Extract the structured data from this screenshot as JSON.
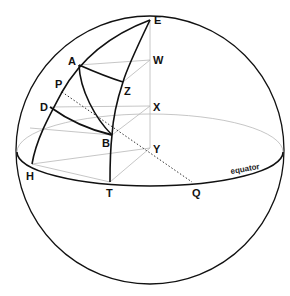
{
  "diagram": {
    "labels": {
      "E": "E",
      "W": "W",
      "A": "A",
      "P": "P",
      "Z": "Z",
      "D": "D",
      "X": "X",
      "B": "B",
      "Y": "Y",
      "H": "H",
      "T": "T",
      "Q": "Q",
      "equator": "equator"
    },
    "colors": {
      "stroke": "#111111",
      "construction": "#b8b8b8",
      "background": "#ffffff"
    }
  }
}
